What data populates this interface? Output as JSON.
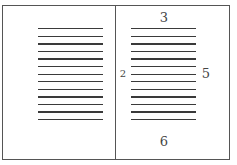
{
  "diagram": {
    "line_count": 13,
    "line_color": "#3a3a3a",
    "border_color": "#555555",
    "margin_labels": {
      "top": "3",
      "inner": "2",
      "outer": "5",
      "bottom": "6"
    }
  }
}
